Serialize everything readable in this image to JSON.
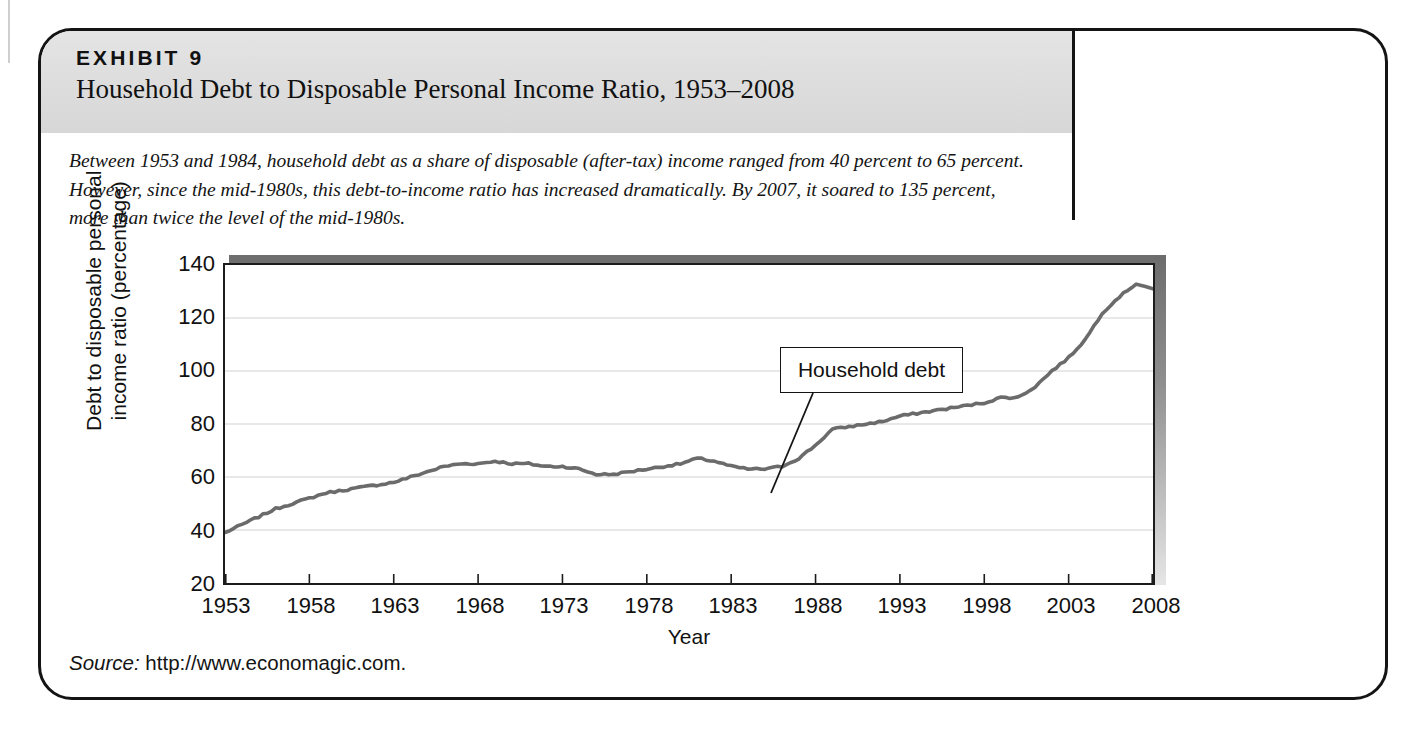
{
  "exhibit": {
    "kicker": "EXHIBIT 9",
    "title": "Household Debt to Disposable Personal Income Ratio, 1953–2008",
    "caption": "Between 1953 and 1984, household debt as a share of disposable (after-tax) income ranged from 40 percent to 65 percent. However, since the mid-1980s, this debt-to-income ratio has increased dramatically. By 2007, it soared to 135 percent, more than twice the level of the mid-1980s.",
    "source_word": "Source:",
    "source_value": " http://www.economagic.com."
  },
  "chart_data": {
    "type": "line",
    "title": "Household Debt to Disposable Personal Income Ratio, 1953–2008",
    "xlabel": "Year",
    "ylabel": "Debt to disposable personal income ratio (percentage)",
    "xlim": [
      1953,
      2008
    ],
    "ylim": [
      20,
      140
    ],
    "xticks": [
      "1953",
      "1958",
      "1963",
      "1968",
      "1973",
      "1978",
      "1983",
      "1988",
      "1993",
      "1998",
      "2003",
      "2008"
    ],
    "yticks": [
      "20",
      "40",
      "60",
      "80",
      "100",
      "120",
      "140"
    ],
    "grid": "horizontal",
    "legend": "none",
    "line_color": "#6b6b6b",
    "annotations": [
      {
        "label": "Household debt",
        "points_to_year": 1984,
        "points_to_value": 63
      }
    ],
    "series": [
      {
        "name": "Household debt",
        "x": [
          1953,
          1954,
          1955,
          1956,
          1957,
          1958,
          1959,
          1960,
          1961,
          1962,
          1963,
          1964,
          1965,
          1966,
          1967,
          1968,
          1969,
          1970,
          1971,
          1972,
          1973,
          1974,
          1975,
          1976,
          1977,
          1978,
          1979,
          1980,
          1981,
          1982,
          1983,
          1984,
          1985,
          1986,
          1987,
          1988,
          1989,
          1990,
          1991,
          1992,
          1993,
          1994,
          1995,
          1996,
          1997,
          1998,
          1999,
          2000,
          2001,
          2002,
          2003,
          2004,
          2005,
          2006,
          2007,
          2008
        ],
        "values": [
          39,
          42,
          45,
          48,
          50,
          52,
          54,
          55,
          56,
          57,
          58,
          60,
          62,
          64,
          65,
          65,
          66,
          65,
          65,
          64,
          64,
          63,
          61,
          61,
          62,
          63,
          64,
          65,
          67,
          66,
          64,
          63,
          63,
          64,
          67,
          72,
          78,
          79,
          80,
          81,
          83,
          84,
          85,
          86,
          87,
          88,
          90,
          90,
          94,
          100,
          105,
          112,
          122,
          128,
          133,
          131
        ]
      }
    ]
  }
}
